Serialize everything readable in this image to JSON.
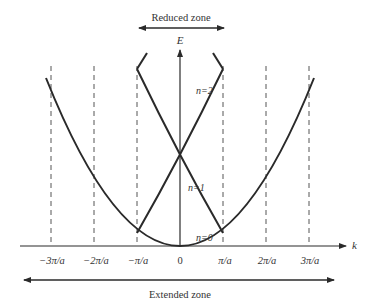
{
  "figure": {
    "type": "band-structure",
    "reduced_zone_label": "Reduced zone",
    "extended_zone_label": "Extended zone",
    "y_axis_label": "E",
    "x_axis_label": "k",
    "tick_labels": [
      "−3π/a",
      "−2π/a",
      "−π/a",
      "0",
      "π/a",
      "2π/a",
      "3π/a"
    ],
    "band_labels": {
      "n0": "n=0",
      "n1": "n=1",
      "n2": "n=2"
    },
    "colors": {
      "curve": "#2a2a2a",
      "dashed": "#555555",
      "text": "#333333"
    }
  }
}
